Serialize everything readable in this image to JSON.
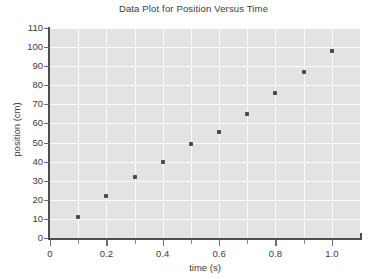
{
  "chart_data": {
    "type": "scatter",
    "title": "Data Plot for Position Versus Time",
    "xlabel": "time (s)",
    "ylabel": "position (cm)",
    "xlim": [
      0,
      1.1
    ],
    "ylim": [
      0,
      110
    ],
    "grid": true,
    "legend": "none",
    "x": [
      0.1,
      0.2,
      0.3,
      0.4,
      0.5,
      0.6,
      0.7,
      0.8,
      0.9,
      1.0
    ],
    "values": [
      11,
      22,
      32,
      40,
      49,
      55.5,
      65,
      76,
      87,
      98
    ],
    "series": [
      {
        "name": "position",
        "x": [
          0.1,
          0.2,
          0.3,
          0.4,
          0.5,
          0.6,
          0.7,
          0.8,
          0.9,
          1.0
        ],
        "values": [
          11,
          22,
          32,
          40,
          49,
          55.5,
          65,
          76,
          87,
          98
        ]
      }
    ],
    "xticks": [
      {
        "value": 0,
        "label": "0",
        "kind": "major"
      },
      {
        "value": 0.1,
        "label": "",
        "kind": "minor"
      },
      {
        "value": 0.2,
        "label": "0.2",
        "kind": "major"
      },
      {
        "value": 0.3,
        "label": "",
        "kind": "minor"
      },
      {
        "value": 0.4,
        "label": "0.4",
        "kind": "major"
      },
      {
        "value": 0.5,
        "label": "",
        "kind": "minor"
      },
      {
        "value": 0.6,
        "label": "0.6",
        "kind": "major"
      },
      {
        "value": 0.7,
        "label": "",
        "kind": "minor"
      },
      {
        "value": 0.8,
        "label": "0.8",
        "kind": "major"
      },
      {
        "value": 0.9,
        "label": "",
        "kind": "minor"
      },
      {
        "value": 1.0,
        "label": "1.0",
        "kind": "major"
      }
    ],
    "yticks": [
      {
        "value": 0,
        "label": "0"
      },
      {
        "value": 10,
        "label": "10"
      },
      {
        "value": 20,
        "label": "20"
      },
      {
        "value": 30,
        "label": "30"
      },
      {
        "value": 40,
        "label": "40"
      },
      {
        "value": 50,
        "label": "50"
      },
      {
        "value": 60,
        "label": "60"
      },
      {
        "value": 70,
        "label": "70"
      },
      {
        "value": 80,
        "label": "80"
      },
      {
        "value": 90,
        "label": "90"
      },
      {
        "value": 100,
        "label": "100"
      },
      {
        "value": 110,
        "label": "110"
      }
    ],
    "colors": {
      "plot_background": "#e2e3e4",
      "gridline": "#fbfbfb",
      "axis": "#4d4d4f",
      "marker": "#4a4a4c",
      "text": "#3b3b3b",
      "page_background": "#ffffff"
    }
  }
}
